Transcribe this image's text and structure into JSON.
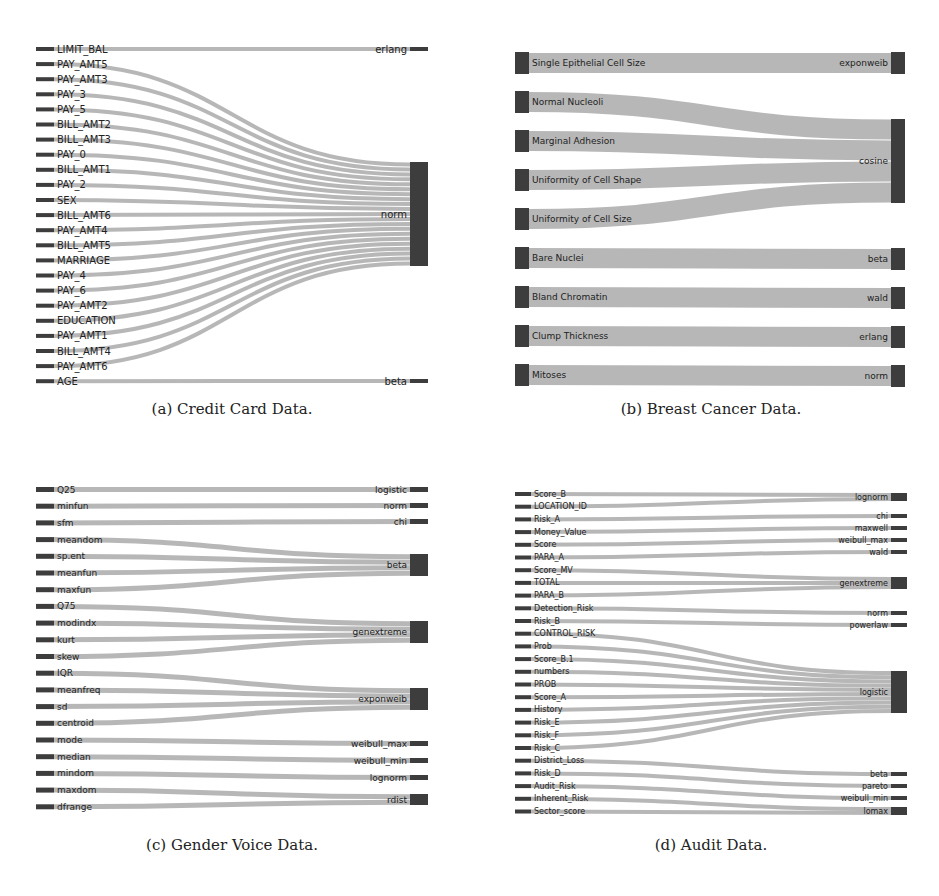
{
  "colors": {
    "node": "#3d3d3d",
    "link": "#b3b3b3",
    "text": "#222222"
  },
  "panels": [
    {
      "id": "a",
      "caption": "(a) Credit Card Data.",
      "box": {
        "x": 36,
        "y": 40,
        "w": 392,
        "h": 350
      },
      "node_w": 18,
      "label_size": 10,
      "label_inside": false,
      "sources": [
        "LIMIT_BAL",
        "PAY_AMT5",
        "PAY_AMT3",
        "PAY_3",
        "PAY_5",
        "BILL_AMT2",
        "BILL_AMT3",
        "PAY_0",
        "BILL_AMT1",
        "PAY_2",
        "SEX",
        "BILL_AMT6",
        "PAY_AMT4",
        "BILL_AMT5",
        "MARRIAGE",
        "PAY_4",
        "PAY_6",
        "PAY_AMT2",
        "EDUCATION",
        "PAY_AMT1",
        "BILL_AMT4",
        "PAY_AMT6",
        "AGE"
      ],
      "targets": [
        {
          "name": "erlang",
          "y": 7,
          "h": 4
        },
        {
          "name": "norm",
          "y": 122,
          "h": 104
        },
        {
          "name": "beta",
          "y": 339,
          "h": 4
        }
      ],
      "links": {
        "LIMIT_BAL": "erlang",
        "AGE": "beta",
        "*": "norm"
      },
      "source_y0": 7,
      "source_step": 15.1,
      "source_h": 4,
      "link_w": 4
    },
    {
      "id": "b",
      "caption": "(b) Breast Cancer Data.",
      "box": {
        "x": 515,
        "y": 52,
        "w": 390,
        "h": 335
      },
      "node_w": 14,
      "label_size": 9,
      "label_inside": true,
      "sources": [
        "Single Epithelial Cell Size",
        "Normal Nucleoli",
        "Marginal Adhesion",
        "Uniformity of Cell Shape",
        "Uniformity of Cell Size",
        "Bare Nuclei",
        "Bland Chromatin",
        "Clump Thickness",
        "Mitoses"
      ],
      "targets": [
        {
          "name": "exponweib",
          "y": 0,
          "h": 22
        },
        {
          "name": "cosine",
          "y": 67,
          "h": 84
        },
        {
          "name": "beta",
          "y": 196,
          "h": 22
        },
        {
          "name": "wald",
          "y": 235,
          "h": 22
        },
        {
          "name": "erlang",
          "y": 274,
          "h": 22
        },
        {
          "name": "norm",
          "y": 313,
          "h": 22
        }
      ],
      "links": {
        "Single Epithelial Cell Size": "exponweib",
        "Normal Nucleoli": "cosine",
        "Marginal Adhesion": "cosine",
        "Uniformity of Cell Shape": "cosine",
        "Uniformity of Cell Size": "cosine",
        "Bare Nuclei": "beta",
        "Bland Chromatin": "wald",
        "Clump Thickness": "erlang",
        "Mitoses": "norm"
      },
      "source_y0": 0,
      "source_step": 39,
      "source_h": 22,
      "link_w": 20
    },
    {
      "id": "c",
      "caption": "(c) Gender Voice Data.",
      "box": {
        "x": 36,
        "y": 484,
        "w": 392,
        "h": 330
      },
      "node_w": 18,
      "label_size": 9,
      "label_inside": false,
      "sources": [
        "Q25",
        "minfun",
        "sfm",
        "meandom",
        "sp.ent",
        "meanfun",
        "maxfun",
        "Q75",
        "modindx",
        "kurt",
        "skew",
        "IQR",
        "meanfreq",
        "sd",
        "centroid",
        "mode",
        "median",
        "mindom",
        "maxdom",
        "dfrange"
      ],
      "targets": [
        {
          "name": "logistic",
          "y": 3,
          "h": 5
        },
        {
          "name": "norm",
          "y": 19,
          "h": 5
        },
        {
          "name": "chi",
          "y": 35,
          "h": 5
        },
        {
          "name": "beta",
          "y": 70,
          "h": 22
        },
        {
          "name": "genextreme",
          "y": 137,
          "h": 22
        },
        {
          "name": "exponweib",
          "y": 204,
          "h": 22
        },
        {
          "name": "weibull_max",
          "y": 257,
          "h": 5
        },
        {
          "name": "weibull_min",
          "y": 274,
          "h": 5
        },
        {
          "name": "lognorm",
          "y": 291,
          "h": 5
        },
        {
          "name": "rdist",
          "y": 310,
          "h": 11
        }
      ],
      "links": {
        "Q25": "logistic",
        "minfun": "norm",
        "sfm": "chi",
        "meandom": "beta",
        "sp.ent": "beta",
        "meanfun": "beta",
        "maxfun": "beta",
        "Q75": "genextreme",
        "modindx": "genextreme",
        "kurt": "genextreme",
        "skew": "genextreme",
        "IQR": "exponweib",
        "meanfreq": "exponweib",
        "sd": "exponweib",
        "centroid": "exponweib",
        "mode": "weibull_max",
        "median": "weibull_min",
        "mindom": "lognorm",
        "maxdom": "rdist",
        "dfrange": "rdist"
      },
      "source_y0": 3,
      "source_step": 16.7,
      "source_h": 5,
      "link_w": 5
    },
    {
      "id": "d",
      "caption": "(d) Audit Data.",
      "box": {
        "x": 515,
        "y": 490,
        "w": 392,
        "h": 330
      },
      "node_w": 16,
      "label_size": 8,
      "label_inside": false,
      "sources": [
        "Score_B",
        "LOCATION_ID",
        "Risk_A",
        "Money_Value",
        "Score",
        "PARA_A",
        "Score_MV",
        "TOTAL",
        "PARA_B",
        "Detection_Risk",
        "Risk_B",
        "CONTROL_RISK",
        "Prob",
        "Score_B.1",
        "numbers",
        "PROB",
        "Score_A",
        "History",
        "Risk_E",
        "Risk_F",
        "Risk_C",
        "District_Loss",
        "Risk_D",
        "Audit_Risk",
        "Inherent_Risk",
        "Sector_score"
      ],
      "targets": [
        {
          "name": "lognorm",
          "y": 3,
          "h": 8
        },
        {
          "name": "chi",
          "y": 24,
          "h": 4
        },
        {
          "name": "maxwell",
          "y": 36,
          "h": 4
        },
        {
          "name": "weibull_max",
          "y": 48,
          "h": 4
        },
        {
          "name": "wald",
          "y": 60,
          "h": 4
        },
        {
          "name": "genextreme",
          "y": 87,
          "h": 12
        },
        {
          "name": "norm",
          "y": 121,
          "h": 4
        },
        {
          "name": "powerlaw",
          "y": 133,
          "h": 4
        },
        {
          "name": "logistic",
          "y": 181,
          "h": 42
        },
        {
          "name": "beta",
          "y": 282,
          "h": 4
        },
        {
          "name": "pareto",
          "y": 294,
          "h": 4
        },
        {
          "name": "weibull_min",
          "y": 306,
          "h": 4
        },
        {
          "name": "lomax",
          "y": 317,
          "h": 8
        }
      ],
      "links": {
        "Score_B": "lognorm",
        "LOCATION_ID": "lognorm",
        "Risk_A": "chi",
        "Money_Value": "maxwell",
        "Score": "weibull_max",
        "PARA_A": "wald",
        "Score_MV": "genextreme",
        "TOTAL": "genextreme",
        "PARA_B": "genextreme",
        "Detection_Risk": "norm",
        "Risk_B": "powerlaw",
        "CONTROL_RISK": "logistic",
        "Prob": "logistic",
        "Score_B.1": "logistic",
        "numbers": "logistic",
        "PROB": "logistic",
        "Score_A": "logistic",
        "History": "logistic",
        "Risk_E": "logistic",
        "Risk_F": "logistic",
        "Risk_C": "logistic",
        "District_Loss": "beta",
        "Risk_D": "pareto",
        "Audit_Risk": "weibull_min",
        "Inherent_Risk": "lomax",
        "Sector_score": "lomax"
      },
      "source_y0": 2,
      "source_step": 12.7,
      "source_h": 4,
      "link_w": 4
    }
  ],
  "captions_pos": [
    {
      "x": 232,
      "y": 400
    },
    {
      "x": 711,
      "y": 400
    },
    {
      "x": 232,
      "y": 836
    },
    {
      "x": 711,
      "y": 836
    }
  ]
}
